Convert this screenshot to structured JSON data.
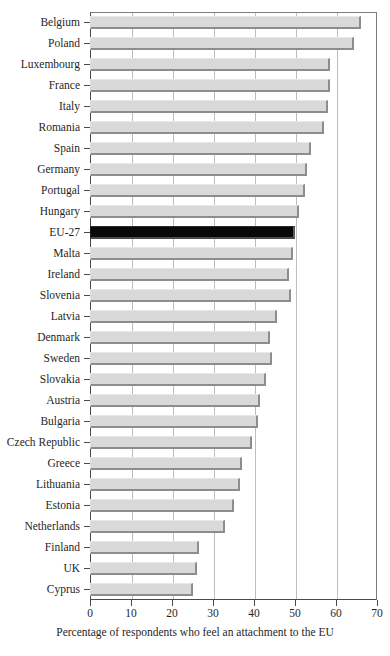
{
  "chart_data": {
    "type": "bar",
    "orientation": "horizontal",
    "title": "",
    "subtitle": "",
    "xlabel": "Percentage of respondents who feel an attachment to the EU",
    "ylabel": "",
    "xlim": [
      0,
      70
    ],
    "xticks": [
      0,
      10,
      20,
      30,
      40,
      50,
      60,
      70
    ],
    "xtick_labels": [
      "0",
      "10",
      "20",
      "30",
      "40",
      "50",
      "60",
      "70"
    ],
    "grid": true,
    "grid_axis": "x",
    "legend": false,
    "legend_position": "none",
    "highlight_category": "EU-27",
    "colors": {
      "bar": "#d9d9d9",
      "bar_edge": "#8d8d8d",
      "highlight_bar": "#080808",
      "axis": "#4a4a4a",
      "gridline": "#bdbdbd",
      "text": "#1f1f1f",
      "background": "#ffffff"
    },
    "categories": [
      "Belgium",
      "Poland",
      "Luxembourg",
      "France",
      "Italy",
      "Romania",
      "Spain",
      "Germany",
      "Portugal",
      "Hungary",
      "EU-27",
      "Malta",
      "Ireland",
      "Slovenia",
      "Latvia",
      "Denmark",
      "Sweden",
      "Slovakia",
      "Austria",
      "Bulgaria",
      "Czech Republic",
      "Greece",
      "Lithuania",
      "Estonia",
      "Netherlands",
      "Finland",
      "UK",
      "Cyprus"
    ],
    "values": [
      66,
      64.5,
      58.5,
      58.5,
      58,
      57,
      54,
      53,
      52.5,
      51,
      50,
      49.5,
      48.5,
      49,
      45.5,
      44,
      44.5,
      43,
      41.5,
      41,
      39.5,
      37,
      36.5,
      35,
      33,
      26.5,
      26,
      25
    ]
  }
}
